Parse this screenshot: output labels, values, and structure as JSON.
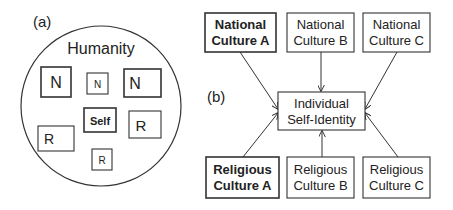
{
  "panel_a": {
    "label": "(a)",
    "circle_label": "Humanity",
    "boxes": [
      {
        "id": "n-large",
        "text": "N",
        "kind": "national"
      },
      {
        "id": "n-small",
        "text": "N",
        "kind": "national"
      },
      {
        "id": "n-right",
        "text": "N",
        "kind": "national"
      },
      {
        "id": "self",
        "text": "Self",
        "kind": "self"
      },
      {
        "id": "r-right",
        "text": "R",
        "kind": "religious"
      },
      {
        "id": "r-left",
        "text": "R",
        "kind": "religious"
      },
      {
        "id": "r-small",
        "text": "R",
        "kind": "religious"
      }
    ]
  },
  "panel_b": {
    "label": "(b)",
    "center": {
      "line1": "Individual",
      "line2": "Self-Identity"
    },
    "national": [
      {
        "line1": "National",
        "line2": "Culture A",
        "bold": true
      },
      {
        "line1": "National",
        "line2": "Culture B",
        "bold": false
      },
      {
        "line1": "National",
        "line2": "Culture C",
        "bold": false
      }
    ],
    "religious": [
      {
        "line1": "Religious",
        "line2": "Culture A",
        "bold": true
      },
      {
        "line1": "Religious",
        "line2": "Culture B",
        "bold": false
      },
      {
        "line1": "Religious",
        "line2": "Culture C",
        "bold": false
      }
    ],
    "edges": [
      {
        "from": "National Culture A",
        "to": "Individual Self-Identity"
      },
      {
        "from": "National Culture B",
        "to": "Individual Self-Identity"
      },
      {
        "from": "National Culture C",
        "to": "Individual Self-Identity"
      },
      {
        "from": "Religious Culture A",
        "to": "Individual Self-Identity"
      },
      {
        "from": "Religious Culture B",
        "to": "Individual Self-Identity"
      },
      {
        "from": "Religious Culture C",
        "to": "Individual Self-Identity"
      }
    ]
  }
}
